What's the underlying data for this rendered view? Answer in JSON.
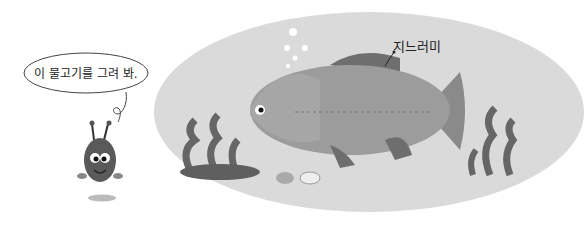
{
  "speech_bubble": {
    "text": "이 물고기를 그려 봐."
  },
  "illustration": {
    "fin_label": "지느러미",
    "colors": {
      "water": "#d9d9d9",
      "fish_body": "#9a9a9a",
      "fin": "#6e6e6e",
      "seaweed": "#6a6a6a"
    }
  }
}
